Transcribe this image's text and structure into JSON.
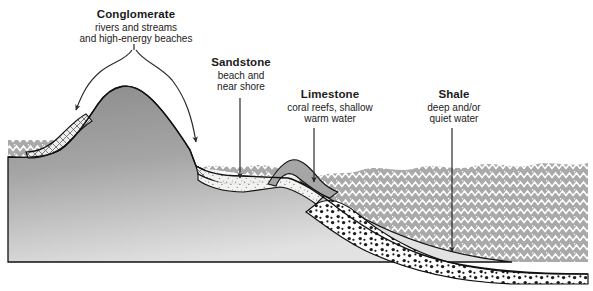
{
  "figure": {
    "kind": "geologic-cross-section",
    "width": 593,
    "height": 291
  },
  "labels": {
    "conglomerate": {
      "title": "Conglomerate",
      "line1": "rivers and streams",
      "line2": "and high-energy beaches"
    },
    "sandstone": {
      "title": "Sandstone",
      "line1": "beach and",
      "line2": "near shore"
    },
    "limestone": {
      "title": "Limestone",
      "line1": "coral reefs, shallow",
      "line2": "warm water"
    },
    "shale": {
      "title": "Shale",
      "line1": "deep and/or",
      "line2": "quiet water"
    }
  },
  "colors": {
    "background": "#ffffff",
    "bedrock_dark": "#8f8f8f",
    "bedrock_light": "#d8d8d8",
    "shale_water": "#a8a8a8",
    "shale_zigzag": "#ffffff",
    "sandstone_fill": "#f2f2f0",
    "sandstone_stipple": "#7a7a7a",
    "conglomerate_fill": "#ededed",
    "conglomerate_hatch": "#6e6e6e",
    "limestone_fill": "#ffffff",
    "limestone_dots": "#1d1d1d",
    "reef_fill": "#a6a6a6",
    "outline": "#111111",
    "text": "#1b1b1b",
    "arrow": "#2a2a2a"
  },
  "annotations": {
    "conglomerate_arrows": 2,
    "sandstone_arrows": 1,
    "limestone_arrows": 1,
    "shale_arrows": 1
  }
}
